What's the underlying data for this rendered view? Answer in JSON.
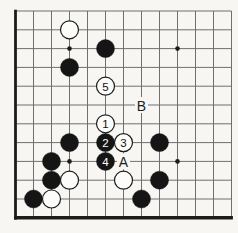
{
  "diagram": {
    "type": "go-board-corner-diagram",
    "colors": {
      "background": "#f7f6f3",
      "grid_line": "#6f6f6f",
      "board_edge": "#1c1c1c",
      "black_stone": "#151515",
      "white_stone_fill": "#fcfcfa",
      "white_stone_stroke": "#1c1c1c",
      "label_text": "#1e1e1e"
    },
    "board": {
      "visible_cols": 13,
      "visible_rows": 12,
      "thick_edge_left": true,
      "thick_edge_bottom": true
    },
    "hoshi_points": [
      {
        "col": 4,
        "row": 3
      },
      {
        "col": 10,
        "row": 3
      },
      {
        "col": 4,
        "row": 9
      },
      {
        "col": 10,
        "row": 9
      }
    ],
    "stones": [
      {
        "col": 4,
        "row": 2,
        "color": "white",
        "label": ""
      },
      {
        "col": 6,
        "row": 3,
        "color": "black",
        "label": ""
      },
      {
        "col": 4,
        "row": 4,
        "color": "black",
        "label": ""
      },
      {
        "col": 6,
        "row": 5,
        "color": "white",
        "label": "5"
      },
      {
        "col": 6,
        "row": 7,
        "color": "white",
        "label": "1"
      },
      {
        "col": 4,
        "row": 8,
        "color": "black",
        "label": ""
      },
      {
        "col": 6,
        "row": 8,
        "color": "black",
        "label": "2"
      },
      {
        "col": 7,
        "row": 8,
        "color": "white",
        "label": "3"
      },
      {
        "col": 9,
        "row": 8,
        "color": "black",
        "label": ""
      },
      {
        "col": 3,
        "row": 9,
        "color": "black",
        "label": ""
      },
      {
        "col": 6,
        "row": 9,
        "color": "black",
        "label": "4"
      },
      {
        "col": 3,
        "row": 10,
        "color": "black",
        "label": ""
      },
      {
        "col": 4,
        "row": 10,
        "color": "white",
        "label": ""
      },
      {
        "col": 7,
        "row": 10,
        "color": "white",
        "label": ""
      },
      {
        "col": 9,
        "row": 10,
        "color": "black",
        "label": ""
      },
      {
        "col": 2,
        "row": 11,
        "color": "black",
        "label": ""
      },
      {
        "col": 3,
        "row": 11,
        "color": "white",
        "label": ""
      },
      {
        "col": 8,
        "row": 11,
        "color": "black",
        "label": ""
      }
    ],
    "point_labels": [
      {
        "col": 7,
        "row": 9,
        "text": "A"
      },
      {
        "col": 8,
        "row": 6,
        "text": "B"
      }
    ]
  }
}
